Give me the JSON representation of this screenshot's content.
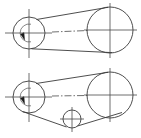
{
  "drawing": {
    "title": "Belt drive assembly line drawing",
    "background_color": "#ffffff",
    "line_color": "#3a3a3a",
    "centerline_color": "#4a4a4a",
    "keyway_color": "#1a1a1a",
    "width": 141,
    "height": 138,
    "views": [
      {
        "name": "open-belt-drive-view",
        "label": "Open belt drive, two pulleys",
        "pulleys": [
          {
            "name": "driver-pulley",
            "label": "Driver pulley",
            "cx": 29,
            "cy": 33,
            "r": 16,
            "inner_r": 9,
            "has_keyway": true
          },
          {
            "name": "driven-pulley",
            "label": "Driven pulley",
            "cx": 110,
            "cy": 30,
            "r": 23,
            "inner_r": 0,
            "has_keyway": false
          }
        ],
        "belt": {
          "name": "belt-outline",
          "label": "Belt tangent lines"
        }
      },
      {
        "name": "idler-belt-drive-view",
        "label": "Belt drive with idler pulley",
        "pulleys": [
          {
            "name": "driver-pulley",
            "label": "Driver pulley",
            "cx": 29,
            "cy": 97,
            "r": 16,
            "inner_r": 9,
            "has_keyway": true
          },
          {
            "name": "driven-pulley",
            "label": "Driven pulley",
            "cx": 110,
            "cy": 95,
            "r": 23,
            "inner_r": 0,
            "has_keyway": false
          },
          {
            "name": "idler-pulley",
            "label": "Idler pulley",
            "cx": 72,
            "cy": 119,
            "r": 9,
            "inner_r": 0,
            "has_keyway": false
          }
        ],
        "belt": {
          "name": "belt-outline",
          "label": "Belt tangent lines over idler"
        }
      }
    ]
  }
}
